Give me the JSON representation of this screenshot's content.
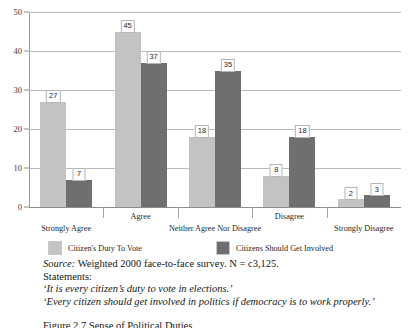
{
  "chart_data": {
    "type": "bar",
    "title": "",
    "xlabel": "",
    "ylabel": "",
    "ylim": [
      0,
      50
    ],
    "yticks": [
      0,
      10,
      20,
      30,
      40,
      50
    ],
    "grid": true,
    "legend_position": "bottom",
    "categories": [
      "Strongly Agree",
      "Agree",
      "Neither Agree Nor Disagree",
      "Disagree",
      "Strongly Disagree"
    ],
    "series": [
      {
        "name": "Citizen's Duty To Vote",
        "color": "#c3c3c3",
        "values": [
          27,
          45,
          18,
          8,
          2
        ]
      },
      {
        "name": "Citizens Should Get Involved",
        "color": "#6f6f6f",
        "values": [
          7,
          37,
          35,
          18,
          3
        ]
      }
    ]
  },
  "caption": {
    "source_label": "Source:",
    "source_text": "Weighted 2000 face-to-face survey. N = c3,125.",
    "statements_label": "Statements:",
    "statement_1": "‘It is every citizen’s duty to vote in elections.’",
    "statement_2": "‘Every citizen should get involved in politics if democracy is to work properly.’",
    "figure_title": "Figure 2.7 Sense of Political Duties"
  }
}
